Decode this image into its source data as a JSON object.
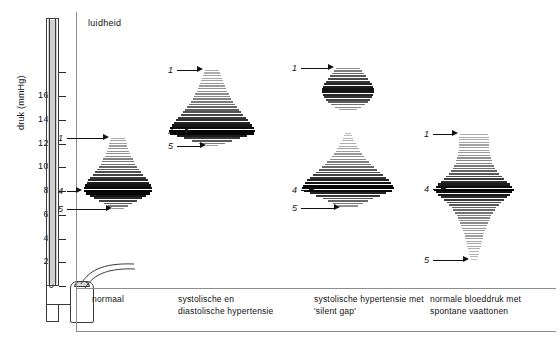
{
  "figure": {
    "axis_title": "druk (mmHg)",
    "loudness_label": "luidheid",
    "y_ticks": [
      {
        "value": 180,
        "label": ""
      },
      {
        "value": 160,
        "label": "160"
      },
      {
        "value": 140,
        "label": "140"
      },
      {
        "value": 120,
        "label": "120"
      },
      {
        "value": 100,
        "label": "100"
      },
      {
        "value": 80,
        "label": "80"
      },
      {
        "value": 60,
        "label": "60"
      },
      {
        "value": 40,
        "label": "40"
      },
      {
        "value": 20,
        "label": "20"
      },
      {
        "value": 0,
        "label": "0"
      }
    ],
    "panels": [
      {
        "id": "normaal",
        "caption_lines": [
          "normaal"
        ],
        "markers": [
          {
            "num": "1",
            "pressure": 125
          },
          {
            "num": "4",
            "pressure": 80
          },
          {
            "num": "5",
            "pressure": 65
          }
        ]
      },
      {
        "id": "systolische-en-diastolische-hypertensie",
        "caption_lines": [
          "systolische en",
          "diastolische  hypertensie"
        ],
        "markers": [
          {
            "num": "1",
            "pressure": 182
          },
          {
            "num": "4",
            "pressure": 130
          },
          {
            "num": "5",
            "pressure": 118
          }
        ]
      },
      {
        "id": "systolische-hypertensie-met-silent-gap",
        "caption_lines": [
          "systolische  hypertensie met",
          "'silent gap'"
        ],
        "markers": [
          {
            "num": "1",
            "pressure": 184
          },
          {
            "num": "4",
            "pressure": 81
          },
          {
            "num": "5",
            "pressure": 66
          }
        ]
      },
      {
        "id": "normale-bloeddruk-met-spontane-vaattonen",
        "caption_lines": [
          "normale bloeddruk  met",
          "spontane  vaattonen"
        ],
        "markers": [
          {
            "num": "1",
            "pressure": 128
          },
          {
            "num": "4",
            "pressure": 82
          },
          {
            "num": "5",
            "pressure": 22
          }
        ]
      }
    ]
  },
  "chart_data": {
    "type": "area",
    "xlabel": "luidheid",
    "ylabel": "druk (mmHg)",
    "ylim": [
      0,
      190
    ],
    "yticks": [
      0,
      20,
      40,
      60,
      80,
      100,
      120,
      140,
      160,
      180
    ],
    "grid": false,
    "legend": "none",
    "note": "Per paneel beschrijft de reeks de luidheid (halve breedte, willekeurige eenheden) en de intensiteit (0-1, zwartheid van de balk) van de Korotkoff-tonen bij afnemende manchetdruk.",
    "series": [
      {
        "name": "normaal",
        "pressure": [
          125,
          120,
          115,
          110,
          105,
          100,
          95,
          90,
          85,
          80,
          75,
          70,
          65
        ],
        "loudness": [
          0.2,
          0.26,
          0.32,
          0.39,
          0.47,
          0.58,
          0.72,
          0.88,
          0.98,
          1.0,
          0.72,
          0.4,
          0.12
        ],
        "intensity": [
          0.16,
          0.2,
          0.25,
          0.31,
          0.39,
          0.5,
          0.64,
          0.8,
          0.93,
          1.0,
          0.82,
          0.52,
          0.2
        ],
        "phase1": 125,
        "phase4": 80,
        "phase5": 65
      },
      {
        "name": "systolische en diastolische hypertensie",
        "pressure": [
          182,
          176,
          170,
          164,
          158,
          152,
          146,
          140,
          134,
          130,
          126,
          122,
          118
        ],
        "loudness": [
          0.17,
          0.22,
          0.28,
          0.35,
          0.44,
          0.55,
          0.68,
          0.83,
          0.96,
          1.0,
          0.7,
          0.38,
          0.1
        ],
        "intensity": [
          0.12,
          0.16,
          0.21,
          0.27,
          0.35,
          0.46,
          0.6,
          0.78,
          0.94,
          1.0,
          0.8,
          0.48,
          0.16
        ],
        "phase1": 182,
        "phase4": 130,
        "phase5": 118
      },
      {
        "name": "systolische hypertensie met 'silent gap'",
        "pressure": [
          184,
          178,
          172,
          166,
          160,
          154,
          148,
          130,
          124,
          118,
          112,
          106,
          100,
          94,
          88,
          84,
          81,
          74,
          66
        ],
        "loudness": [
          0.26,
          0.38,
          0.5,
          0.58,
          0.52,
          0.4,
          0.16,
          0.06,
          0.12,
          0.2,
          0.3,
          0.43,
          0.58,
          0.76,
          0.94,
          1.0,
          0.96,
          0.52,
          0.12
        ],
        "intensity": [
          0.28,
          0.52,
          0.78,
          0.92,
          0.74,
          0.46,
          0.18,
          0.05,
          0.09,
          0.15,
          0.23,
          0.34,
          0.48,
          0.68,
          0.9,
          1.0,
          0.94,
          0.56,
          0.18
        ],
        "silent_gap": [
          148,
          130
        ],
        "phase1": 184,
        "phase4": 81,
        "phase5": 66
      },
      {
        "name": "normale bloeddruk met spontane vaattonen",
        "pressure": [
          128,
          122,
          116,
          110,
          104,
          98,
          92,
          86,
          82,
          78,
          72,
          66,
          58,
          50,
          42,
          34,
          28,
          22
        ],
        "loudness": [
          0.36,
          0.37,
          0.38,
          0.4,
          0.46,
          0.56,
          0.72,
          0.9,
          1.0,
          0.9,
          0.7,
          0.54,
          0.4,
          0.3,
          0.23,
          0.17,
          0.12,
          0.07
        ],
        "intensity": [
          0.12,
          0.15,
          0.19,
          0.25,
          0.34,
          0.47,
          0.66,
          0.88,
          1.0,
          0.88,
          0.66,
          0.48,
          0.34,
          0.25,
          0.19,
          0.14,
          0.1,
          0.06
        ],
        "phase1": 128,
        "phase4": 82,
        "phase5": 22
      }
    ]
  }
}
